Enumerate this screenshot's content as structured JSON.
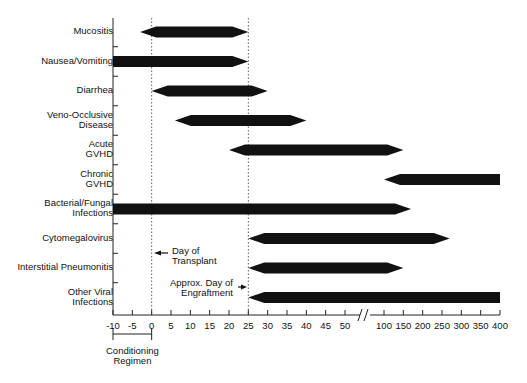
{
  "chart_data": {
    "type": "bar",
    "subtype": "timeline-range",
    "title": "",
    "xlabel": "Days relative to transplant",
    "ylabel": "",
    "x_ticks": [
      "-10",
      "-5",
      "0",
      "5",
      "10",
      "15",
      "20",
      "25",
      "30",
      "35",
      "40",
      "45",
      "50",
      "100",
      "150",
      "200",
      "250",
      "300",
      "350",
      "400"
    ],
    "axis_break": "between 50 and 100",
    "categories": [
      "Mucositis",
      "Nausea/Vomiting",
      "Diarrhea",
      "Veno-Occlusive\nDisease",
      "Acute\nGVHD",
      "Chronic\nGVHD",
      "Bacterial/Fungal\nInfections",
      "Cytomegalovirus",
      "Interstitial Pneumonitis",
      "Other Viral\nInfections"
    ],
    "series": [
      {
        "name": "Mucositis",
        "start": -3,
        "end": 25,
        "start_shape": "point",
        "end_shape": "point"
      },
      {
        "name": "Nausea/Vomiting",
        "start": -10,
        "end": 25,
        "start_shape": "flat",
        "end_shape": "point"
      },
      {
        "name": "Diarrhea",
        "start": 0,
        "end": 30,
        "start_shape": "point",
        "end_shape": "point"
      },
      {
        "name": "Veno-Occlusive Disease",
        "start": 6,
        "end": 40,
        "start_shape": "point",
        "end_shape": "point"
      },
      {
        "name": "Acute GVHD",
        "start": 20,
        "end": 150,
        "start_shape": "point",
        "end_shape": "point"
      },
      {
        "name": "Chronic GVHD",
        "start": 100,
        "end": 400,
        "start_shape": "point",
        "end_shape": "flat"
      },
      {
        "name": "Bacterial/Fungal Infections",
        "start": -10,
        "end": 170,
        "start_shape": "flat",
        "end_shape": "point"
      },
      {
        "name": "Cytomegalovirus",
        "start": 25,
        "end": 270,
        "start_shape": "point",
        "end_shape": "point"
      },
      {
        "name": "Interstitial Pneumonitis",
        "start": 25,
        "end": 150,
        "start_shape": "point",
        "end_shape": "point"
      },
      {
        "name": "Other Viral Infections",
        "start": 25,
        "end": 400,
        "start_shape": "point",
        "end_shape": "flat"
      }
    ],
    "reference_lines": [
      {
        "x": 0,
        "label": "Day of\nTransplant",
        "style": "dotted"
      },
      {
        "x": 25,
        "label": "Approx. Day of\nEngraftment",
        "style": "dotted"
      }
    ],
    "bracket": {
      "from": -10,
      "to": 0,
      "label": "Conditioning\nRegimen"
    },
    "bar_color": "#111111"
  },
  "labels": {
    "day_of_transplant": "Day of\nTransplant",
    "engraftment": "Approx. Day of\nEngraftment",
    "conditioning": "Conditioning\nRegimen"
  }
}
